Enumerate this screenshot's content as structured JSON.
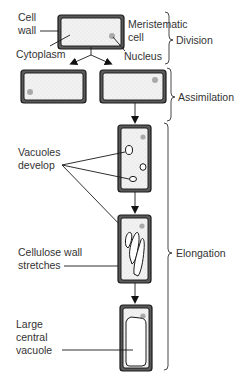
{
  "diagram": {
    "labels": {
      "cell_wall": [
        "Cell",
        "wall"
      ],
      "cytoplasm": "Cytoplasm",
      "meristematic_cell": [
        "Meristematic",
        "cell"
      ],
      "nucleus": "Nucleus",
      "vacuoles_develop": [
        "Vacuoles",
        "develop"
      ],
      "cellulose_wall_stretches": [
        "Cellulose wall",
        "stretches"
      ],
      "large_central_vacuole": [
        "Large",
        "central",
        "vacuole"
      ]
    },
    "stages": [
      {
        "name": "Division"
      },
      {
        "name": "Assimilation"
      },
      {
        "name": "Elongation"
      }
    ],
    "colors": {
      "wall": "#5a5a5a",
      "outline": "#1a1a1a",
      "nucleus": "#a9a9a9",
      "text": "#333333"
    }
  }
}
